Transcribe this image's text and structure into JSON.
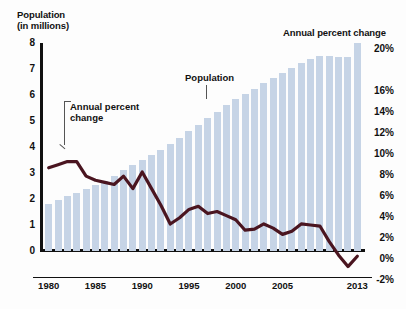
{
  "titles": {
    "left_axis": "Population\n(in millions)",
    "left_axis_line1": "Population",
    "left_axis_line2": "(in millions)",
    "right_axis": "Annual percent change"
  },
  "annotations": {
    "line_series": "Annual percent\nchange",
    "line_series_l1": "Annual percent",
    "line_series_l2": "change",
    "bar_series": "Population"
  },
  "colors": {
    "bar": "#c6d4e6",
    "line": "#4a1520",
    "axis": "#111111",
    "background": "#fdfdfd"
  },
  "chart_data": {
    "type": "bar",
    "xlabel": "",
    "ylabel": "Population (in millions)",
    "y2label": "Annual percent change",
    "ylim": [
      0,
      8
    ],
    "y2lim": [
      -2,
      20
    ],
    "grid": false,
    "legend": "in-chart annotations",
    "x_tick_labels": [
      "1980",
      "1985",
      "1990",
      "1995",
      "2000",
      "2005",
      "2013"
    ],
    "x_tick_years": [
      1980,
      1985,
      1990,
      1995,
      2000,
      2005,
      2013
    ],
    "y_tick_labels": [
      "8",
      "7",
      "6",
      "5",
      "4",
      "3",
      "2",
      "1",
      "0"
    ],
    "y_tick_values": [
      8,
      7,
      6,
      5,
      4,
      3,
      2,
      1,
      0
    ],
    "y2_tick_labels": [
      "20%",
      "16%",
      "14%",
      "12%",
      "10%",
      "8%",
      "6%",
      "4%",
      "2%",
      "0%",
      "-2%"
    ],
    "y2_tick_values": [
      20,
      16,
      14,
      12,
      10,
      8,
      6,
      4,
      2,
      0,
      -2
    ],
    "x": [
      1980,
      1981,
      1982,
      1983,
      1984,
      1985,
      1986,
      1987,
      1988,
      1989,
      1990,
      1991,
      1992,
      1993,
      1994,
      1995,
      1996,
      1997,
      1998,
      1999,
      2000,
      2001,
      2002,
      2003,
      2004,
      2005,
      2006,
      2007,
      2008,
      2009,
      2010,
      2011,
      2012,
      2013
    ],
    "series": [
      {
        "name": "Population",
        "type": "bar",
        "axis": "left",
        "unit": "millions",
        "values": [
          1.8,
          1.95,
          2.1,
          2.25,
          2.4,
          2.55,
          2.7,
          2.9,
          3.1,
          3.3,
          3.5,
          3.7,
          3.9,
          4.1,
          4.35,
          4.6,
          4.85,
          5.1,
          5.35,
          5.6,
          5.85,
          6.05,
          6.25,
          6.45,
          6.65,
          6.85,
          7.05,
          7.25,
          7.4,
          7.5,
          7.5,
          7.45,
          7.45,
          8.0
        ]
      },
      {
        "name": "Annual percent change",
        "type": "line",
        "axis": "right",
        "unit": "percent",
        "values": [
          8.0,
          8.3,
          8.6,
          8.6,
          7.2,
          6.8,
          6.6,
          6.4,
          7.2,
          6.0,
          7.6,
          6.0,
          4.4,
          2.6,
          3.2,
          4.0,
          4.3,
          3.6,
          3.8,
          3.4,
          3.0,
          2.0,
          2.1,
          2.6,
          2.2,
          1.6,
          1.9,
          2.6,
          2.5,
          2.4,
          0.9,
          -0.4,
          -1.5,
          -0.5
        ]
      }
    ]
  }
}
